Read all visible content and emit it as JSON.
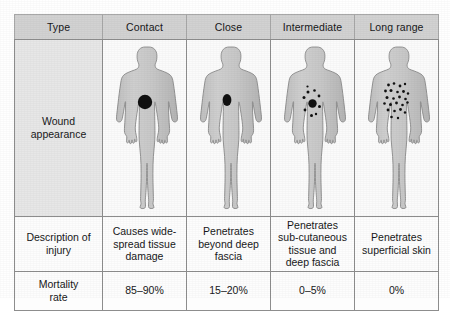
{
  "table": {
    "columns": [
      {
        "key": "type",
        "label": "Type"
      },
      {
        "key": "contact",
        "label": "Contact"
      },
      {
        "key": "close",
        "label": "Close"
      },
      {
        "key": "intermediate",
        "label": "Intermediate"
      },
      {
        "key": "long_range",
        "label": "Long range"
      }
    ],
    "rows": {
      "wound_appearance": {
        "label_line1": "Wound",
        "label_line2": "appearance",
        "figures": [
          {
            "name": "body-figure-contact",
            "pattern": "single-large-round-wound",
            "marks": [
              {
                "cx": 42,
                "cy": 62,
                "rx": 7.2,
                "ry": 7.2
              }
            ]
          },
          {
            "name": "body-figure-close",
            "pattern": "single-small-oval-wound",
            "marks": [
              {
                "cx": 40,
                "cy": 60,
                "rx": 4.4,
                "ry": 6.0
              }
            ]
          },
          {
            "name": "body-figure-intermediate",
            "pattern": "central-wound-with-satellite-pellets",
            "marks": [
              {
                "cx": 41.5,
                "cy": 63.5,
                "rx": 4.2,
                "ry": 4.2
              },
              {
                "cx": 37.0,
                "cy": 52.0,
                "rx": 1.5,
                "ry": 1.5
              },
              {
                "cx": 43.5,
                "cy": 50.5,
                "rx": 1.3,
                "ry": 1.3
              },
              {
                "cx": 33.0,
                "cy": 57.5,
                "rx": 1.5,
                "ry": 1.5
              },
              {
                "cx": 48.0,
                "cy": 56.0,
                "rx": 1.4,
                "ry": 1.4
              },
              {
                "cx": 48.5,
                "cy": 66.5,
                "rx": 1.5,
                "ry": 1.5
              },
              {
                "cx": 34.0,
                "cy": 70.0,
                "rx": 1.4,
                "ry": 1.4
              },
              {
                "cx": 40.5,
                "cy": 75.5,
                "rx": 1.5,
                "ry": 1.5
              },
              {
                "cx": 45.0,
                "cy": 74.0,
                "rx": 1.2,
                "ry": 1.2
              },
              {
                "cx": 36.5,
                "cy": 46.5,
                "rx": 1.1,
                "ry": 1.1
              }
            ]
          },
          {
            "name": "body-figure-long-range",
            "pattern": "wide-scattered-pellet-spray",
            "marks": [
              {
                "cx": 33.5,
                "cy": 45.0,
                "rx": 1.4,
                "ry": 1.4
              },
              {
                "cx": 39.0,
                "cy": 43.5,
                "rx": 1.3,
                "ry": 1.3
              },
              {
                "cx": 45.0,
                "cy": 46.0,
                "rx": 1.4,
                "ry": 1.4
              },
              {
                "cx": 50.0,
                "cy": 44.0,
                "rx": 1.2,
                "ry": 1.2
              },
              {
                "cx": 30.5,
                "cy": 51.0,
                "rx": 1.4,
                "ry": 1.4
              },
              {
                "cx": 36.0,
                "cy": 50.5,
                "rx": 1.5,
                "ry": 1.5
              },
              {
                "cx": 42.5,
                "cy": 52.0,
                "rx": 1.3,
                "ry": 1.3
              },
              {
                "cx": 48.5,
                "cy": 51.5,
                "rx": 1.4,
                "ry": 1.4
              },
              {
                "cx": 53.0,
                "cy": 53.5,
                "rx": 1.2,
                "ry": 1.2
              },
              {
                "cx": 32.0,
                "cy": 57.5,
                "rx": 1.5,
                "ry": 1.5
              },
              {
                "cx": 38.5,
                "cy": 58.5,
                "rx": 1.3,
                "ry": 1.3
              },
              {
                "cx": 44.5,
                "cy": 57.0,
                "rx": 1.4,
                "ry": 1.4
              },
              {
                "cx": 50.5,
                "cy": 59.0,
                "rx": 1.3,
                "ry": 1.3
              },
              {
                "cx": 29.5,
                "cy": 63.5,
                "rx": 1.3,
                "ry": 1.3
              },
              {
                "cx": 35.5,
                "cy": 64.5,
                "rx": 1.5,
                "ry": 1.5
              },
              {
                "cx": 41.5,
                "cy": 63.0,
                "rx": 1.4,
                "ry": 1.4
              },
              {
                "cx": 47.5,
                "cy": 65.0,
                "rx": 1.3,
                "ry": 1.3
              },
              {
                "cx": 52.5,
                "cy": 62.5,
                "rx": 1.2,
                "ry": 1.2
              },
              {
                "cx": 33.0,
                "cy": 70.0,
                "rx": 1.4,
                "ry": 1.4
              },
              {
                "cx": 39.5,
                "cy": 71.0,
                "rx": 1.3,
                "ry": 1.3
              },
              {
                "cx": 45.5,
                "cy": 69.5,
                "rx": 1.4,
                "ry": 1.4
              },
              {
                "cx": 50.0,
                "cy": 72.5,
                "rx": 1.2,
                "ry": 1.2
              },
              {
                "cx": 36.5,
                "cy": 77.0,
                "rx": 1.3,
                "ry": 1.3
              },
              {
                "cx": 43.0,
                "cy": 78.0,
                "rx": 1.2,
                "ry": 1.2
              }
            ]
          }
        ]
      },
      "description_of_injury": {
        "label_line1": "Description of",
        "label_line2": "injury",
        "values": [
          "Causes wide-spread tissue damage",
          "Penetrates beyond deep fascia",
          "Penetrates sub-cutaneous tissue and deep fascia",
          "Penetrates superficial skin"
        ]
      },
      "mortality_rate": {
        "label_line1": "Mortality",
        "label_line2": "rate",
        "values": [
          "85–90%",
          "15–20%",
          "0–5%",
          "0%"
        ]
      }
    }
  },
  "colors": {
    "header_background": "#d2d2d2",
    "row_label_background": "#e7e7e7",
    "cell_background": "#fdfdfd",
    "border": "#8d8d8d",
    "body_fill": "#c9c9c9",
    "body_outline": "#8a8a8a",
    "wound_mark": "#111111",
    "text": "#18181a"
  }
}
